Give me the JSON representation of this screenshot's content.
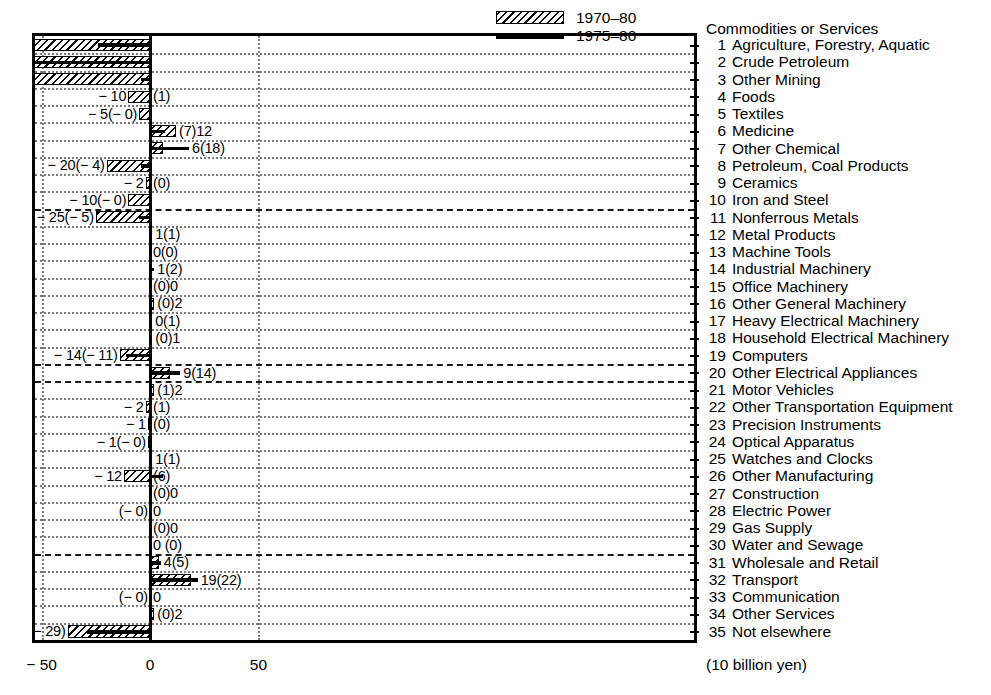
{
  "chart_data": {
    "type": "bar",
    "title": "",
    "xlabel": "(10 billion yen)",
    "ylabel": "Commodities or Services",
    "orientation": "horizontal",
    "xlim": [
      -170,
      90
    ],
    "xticks": [
      -150,
      -100,
      -50,
      0,
      50
    ],
    "xtick_labels": [
      "− 150",
      "− 100",
      "− 50",
      "0",
      "50"
    ],
    "grid": true,
    "legend_position": "top-right-inside",
    "series": [
      {
        "name": "1970–80",
        "style": "hatched-bar"
      },
      {
        "name": "1975–80",
        "style": "solid-line"
      }
    ],
    "categories": [
      "Agriculture, Forestry, Aquatic",
      "Crude Petroleum",
      "Other Mining",
      "Foods",
      "Textiles",
      "Medicine",
      "Other Chemical",
      "Petroleum, Coal Products",
      "Ceramics",
      "Iron and Steel",
      "Nonferrous Metals",
      "Metal Products",
      "Machine Tools",
      "Industrial Machinery",
      "Office Machinery",
      "Other General Machinery",
      "Heavy Electrical Machinery",
      "Household Electrical Machinery",
      "Computers",
      "Other Electrical Appliances",
      "Motor Vehicles",
      "Other Transportation Equipment",
      "Precision Instruments",
      "Optical Apparatus",
      "Watches and Clocks",
      "Other Manufacturing",
      "Construction",
      "Electric Power",
      "Gas Supply",
      "Water and Sewage",
      "Wholesale and Retail",
      "Transport",
      "Communication",
      "Other Services",
      "Not elsewhere"
    ],
    "rows": [
      {
        "n": 1,
        "name": "Agriculture, Forestry, Aquatic",
        "v70": -84,
        "v75": -24,
        "label": "− 84(− 24)",
        "label_side": "left"
      },
      {
        "n": 2,
        "name": "Crude Petroleum",
        "v70": -128,
        "v75": -53,
        "label": "− 128(− 53)",
        "label_side": "left"
      },
      {
        "n": 3,
        "name": "Other Mining",
        "v70": -62,
        "v75": -4,
        "label": "− 62(− 4)",
        "label_side": "left"
      },
      {
        "n": 4,
        "name": "Foods",
        "v70": -10,
        "v75": 1,
        "label": "− 10",
        "label_side": "left",
        "label2": "(1)"
      },
      {
        "n": 5,
        "name": "Textiles",
        "v70": -5,
        "v75": 0,
        "label": "− 5(− 0)",
        "label_side": "left"
      },
      {
        "n": 6,
        "name": "Medicine",
        "v70": 12,
        "v75": 7,
        "label": "(7)12",
        "label_side": "right"
      },
      {
        "n": 7,
        "name": "Other Chemical",
        "v70": 6,
        "v75": 18,
        "label": "6(18)",
        "label_side": "right"
      },
      {
        "n": 8,
        "name": "Petroleum, Coal Products",
        "v70": -20,
        "v75": -4,
        "label": "− 20(− 4)",
        "label_side": "left"
      },
      {
        "n": 9,
        "name": "Ceramics",
        "v70": -2,
        "v75": 0,
        "label": "− 2",
        "label_side": "left",
        "label2": "(0)"
      },
      {
        "n": 10,
        "name": "Iron and Steel",
        "v70": -10,
        "v75": 0,
        "label": "− 10(− 0)",
        "label_side": "left"
      },
      {
        "n": 11,
        "name": "Nonferrous Metals",
        "v70": -25,
        "v75": -5,
        "label": "− 25(− 5)",
        "label_side": "left"
      },
      {
        "n": 12,
        "name": "Metal Products",
        "v70": 1,
        "v75": 1,
        "label": "1(1)",
        "label_side": "right"
      },
      {
        "n": 13,
        "name": "Machine Tools",
        "v70": 0,
        "v75": 0,
        "label": "0(0)",
        "label_side": "right"
      },
      {
        "n": 14,
        "name": "Industrial Machinery",
        "v70": 1,
        "v75": 2,
        "label": "1(2)",
        "label_side": "right"
      },
      {
        "n": 15,
        "name": "Office Machinery",
        "v70": 0,
        "v75": 0,
        "label": "(0)0",
        "label_side": "right"
      },
      {
        "n": 16,
        "name": "Other General Machinery",
        "v70": 2,
        "v75": 0,
        "label": "(0)2",
        "label_side": "right"
      },
      {
        "n": 17,
        "name": "Heavy Electrical Machinery",
        "v70": 0,
        "v75": 1,
        "label": "0(1)",
        "label_side": "right"
      },
      {
        "n": 18,
        "name": "Household Electrical Machinery",
        "v70": 1,
        "v75": 0,
        "label": "(0)1",
        "label_side": "right"
      },
      {
        "n": 19,
        "name": "Computers",
        "v70": -14,
        "v75": -11,
        "label": "− 14(− 11)",
        "label_side": "left"
      },
      {
        "n": 20,
        "name": "Other Electrical Appliances",
        "v70": 9,
        "v75": 14,
        "label": "9(14)",
        "label_side": "right"
      },
      {
        "n": 21,
        "name": "Motor Vehicles",
        "v70": 2,
        "v75": 1,
        "label": "(1)2",
        "label_side": "right"
      },
      {
        "n": 22,
        "name": "Other Transportation Equipment",
        "v70": -2,
        "v75": 1,
        "label": "− 2",
        "label_side": "left",
        "label2": "(1)"
      },
      {
        "n": 23,
        "name": "Precision Instruments",
        "v70": -1,
        "v75": 0,
        "label": "− 1",
        "label_side": "left",
        "label2": "(0)"
      },
      {
        "n": 24,
        "name": "Optical Apparatus",
        "v70": -1,
        "v75": 0,
        "label": "− 1(− 0)",
        "label_side": "left"
      },
      {
        "n": 25,
        "name": "Watches and Clocks",
        "v70": 1,
        "v75": 1,
        "label": "1(1)",
        "label_side": "right"
      },
      {
        "n": 26,
        "name": "Other Manufacturing",
        "v70": -12,
        "v75": 6,
        "label": "− 12",
        "label_side": "left",
        "label2": "(6)"
      },
      {
        "n": 27,
        "name": "Construction",
        "v70": 0,
        "v75": 0,
        "label": "(0)0",
        "label_side": "right"
      },
      {
        "n": 28,
        "name": "Electric Power",
        "v70": 0,
        "v75": 0,
        "label": "(− 0)",
        "label_side": "left",
        "label2": "0"
      },
      {
        "n": 29,
        "name": "Gas Supply",
        "v70": 0,
        "v75": 0,
        "label": "(0)0",
        "label_side": "right"
      },
      {
        "n": 30,
        "name": "Water and Sewage",
        "v70": 0,
        "v75": 0,
        "label": "0 (0)",
        "label_side": "right"
      },
      {
        "n": 31,
        "name": "Wholesale and Retail",
        "v70": 4,
        "v75": 5,
        "label": "4(5)",
        "label_side": "right"
      },
      {
        "n": 32,
        "name": "Transport",
        "v70": 19,
        "v75": 22,
        "label": "19(22)",
        "label_side": "right"
      },
      {
        "n": 33,
        "name": "Communication",
        "v70": 0,
        "v75": 0,
        "label": "(− 0)",
        "label_side": "left",
        "label2": "0"
      },
      {
        "n": 34,
        "name": "Other Services",
        "v70": 2,
        "v75": 0,
        "label": "(0)2",
        "label_side": "right"
      },
      {
        "n": 35,
        "name": "Not elsewhere",
        "v70": -38,
        "v75": -29,
        "label": "− 38(− 29)",
        "label_side": "left"
      }
    ]
  },
  "legend": {
    "items": [
      {
        "label": "1970–80",
        "swatch": "hatched"
      },
      {
        "label": "1975–80",
        "swatch": "solid"
      }
    ]
  },
  "category_panel": {
    "heading": "Commodities or Services"
  },
  "axis": {
    "unit": "(10 billion yen)",
    "ticks": [
      "− 150",
      "− 100",
      "− 50",
      "0",
      "50"
    ]
  },
  "colors": {
    "ink": "#000000",
    "grid": "#7a7a7a",
    "background": "#ffffff"
  }
}
